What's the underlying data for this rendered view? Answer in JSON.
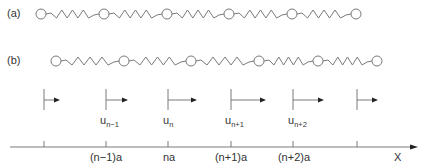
{
  "colors": {
    "line": "#7a7a7a",
    "text": "#333333",
    "mass_fill": "#ffffff"
  },
  "panel_a": {
    "label": "(a)",
    "mass_x": [
      41,
      104,
      167,
      229,
      292,
      356
    ],
    "y": 14
  },
  "panel_b": {
    "label": "(b)",
    "mass_x": [
      56,
      124,
      191,
      259,
      318,
      377
    ],
    "y": 61
  },
  "displacements": [
    {
      "x": 44,
      "len": 16,
      "label": "",
      "sub": ""
    },
    {
      "x": 106,
      "len": 22,
      "label": "u",
      "sub": "n−1"
    },
    {
      "x": 168,
      "len": 29,
      "label": "u",
      "sub": "n"
    },
    {
      "x": 231,
      "len": 35,
      "label": "u",
      "sub": "n+1"
    },
    {
      "x": 293,
      "len": 31,
      "label": "u",
      "sub": "n+2"
    },
    {
      "x": 357,
      "len": 21,
      "label": "",
      "sub": ""
    }
  ],
  "axis": {
    "label": "X",
    "ticks": [
      {
        "x": 44,
        "label": ""
      },
      {
        "x": 106,
        "label": "(n−1)a"
      },
      {
        "x": 168,
        "label": "na"
      },
      {
        "x": 231,
        "label": "(n+1)a"
      },
      {
        "x": 293,
        "label": "(n+2)a"
      },
      {
        "x": 357,
        "label": ""
      }
    ]
  }
}
